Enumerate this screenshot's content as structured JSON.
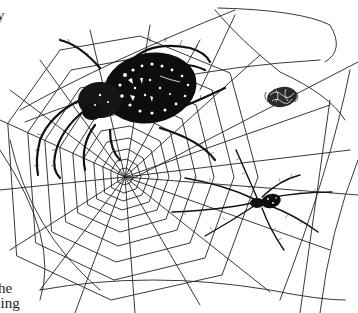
{
  "illustration": {
    "subject": "Orb-weaver spiders on a web with wrapped prey",
    "style": "black-and-white pen-and-ink engraving",
    "ink_color": "#111111",
    "paper_color": "#ffffff",
    "elements": {
      "web": {
        "name": "orb web",
        "hub": [
          125,
          177
        ]
      },
      "large_spider": {
        "name": "large orb-weaver spider",
        "position": "upper-left"
      },
      "prey": {
        "name": "wrapped fly prey bundle",
        "position": "upper-right"
      },
      "small_spider": {
        "name": "smaller spider",
        "position": "lower-right"
      }
    }
  },
  "text_fragments": {
    "top_left": "y",
    "bottom_left_line1": "he",
    "bottom_left_line2": "ding"
  }
}
